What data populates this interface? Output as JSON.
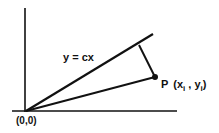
{
  "diagram": {
    "type": "geometry-projection",
    "line_label": "y = cx",
    "origin_label": "(0,0)",
    "point": {
      "prefix": "P",
      "x_var": "x",
      "y_var": "y",
      "subscript": "i"
    },
    "elements": [
      "vertical-axis",
      "horizontal-axis",
      "line y = cx through origin",
      "segment from origin to P",
      "perpendicular from P to line y = cx",
      "point P"
    ],
    "colors": {
      "stroke": "#111111",
      "background": "#ffffff"
    }
  }
}
